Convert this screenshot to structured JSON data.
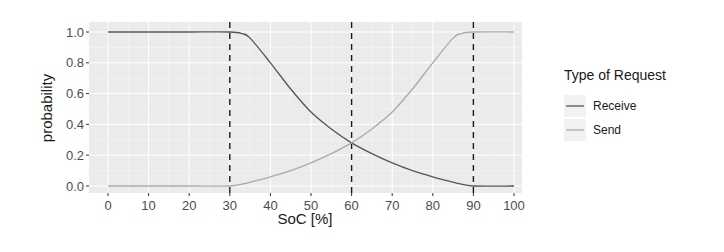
{
  "chart_data": {
    "type": "line",
    "title": "",
    "xlabel": "SoC [%]",
    "ylabel": "probability",
    "xlim": [
      0,
      100
    ],
    "ylim": [
      0,
      1
    ],
    "x_ticks": [
      0,
      10,
      20,
      30,
      40,
      50,
      60,
      70,
      80,
      90,
      100
    ],
    "x_tick_labels": [
      "0",
      "10",
      "20",
      "30",
      "40",
      "50",
      "60",
      "70",
      "80",
      "90",
      "100"
    ],
    "y_ticks": [
      0.0,
      0.2,
      0.4,
      0.6,
      0.8,
      1.0
    ],
    "y_tick_labels": [
      "0.0",
      "0.2",
      "0.4",
      "0.6",
      "0.8",
      "1.0"
    ],
    "grid": true,
    "vertical_reference_lines": [
      30,
      60,
      90
    ],
    "reference_line_style": "dashed",
    "legend": {
      "title": "Type of Request",
      "position": "right",
      "entries": [
        "Receive",
        "Send"
      ]
    },
    "x": [
      0,
      10,
      20,
      30,
      33,
      35,
      40,
      45,
      50,
      55,
      60,
      65,
      70,
      75,
      80,
      85,
      87,
      90,
      100
    ],
    "series": [
      {
        "name": "Receive",
        "color": "#555555",
        "values": [
          1.0,
          1.0,
          1.0,
          1.0,
          0.99,
          0.96,
          0.8,
          0.63,
          0.48,
          0.37,
          0.28,
          0.21,
          0.15,
          0.1,
          0.06,
          0.025,
          0.012,
          0.0,
          0.0
        ]
      },
      {
        "name": "Send",
        "color": "#aaaaaa",
        "values": [
          0.0,
          0.0,
          0.0,
          0.0,
          0.012,
          0.025,
          0.06,
          0.1,
          0.15,
          0.21,
          0.28,
          0.37,
          0.48,
          0.63,
          0.8,
          0.96,
          0.99,
          1.0,
          1.0
        ]
      }
    ]
  },
  "colors": {
    "panel_background": "#ebebeb",
    "grid_major": "#ffffff",
    "reference_line": "#1a1a1a",
    "receive": "#555555",
    "send": "#aaaaaa"
  }
}
